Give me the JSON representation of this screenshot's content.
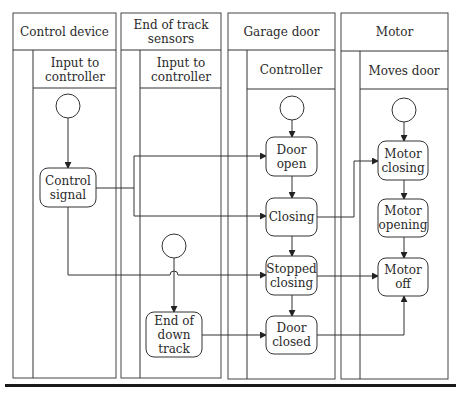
{
  "lanes": [
    {
      "title": "Control device",
      "subtitle": "Input to controller"
    },
    {
      "title": "End of track sensors",
      "subtitle": "Input to controller"
    },
    {
      "title": "Garage door",
      "subtitle": "Controller"
    },
    {
      "title": "Motor",
      "subtitle": "Moves door"
    }
  ],
  "nodes": {
    "control_signal": "Control signal",
    "end_of_down_track": "End of down track",
    "door_open": "Door open",
    "closing": "Closing",
    "stopped_closing": "Stopped closing",
    "door_closed": "Door closed",
    "motor_closing": "Motor closing",
    "motor_opening": "Motor opening",
    "motor_off": "Motor off"
  },
  "edges": [
    {
      "from": "control-device-start",
      "to": "control_signal"
    },
    {
      "from": "control_signal",
      "to": "door_open"
    },
    {
      "from": "control_signal",
      "to": "closing"
    },
    {
      "from": "control_signal",
      "to": "stopped_closing"
    },
    {
      "from": "end-of-track-start",
      "to": "end_of_down_track"
    },
    {
      "from": "end_of_down_track",
      "to": "door_closed"
    },
    {
      "from": "controller-start",
      "to": "door_open"
    },
    {
      "from": "door_open",
      "to": "closing"
    },
    {
      "from": "closing",
      "to": "stopped_closing"
    },
    {
      "from": "stopped_closing",
      "to": "door_closed"
    },
    {
      "from": "closing",
      "to": "motor_closing"
    },
    {
      "from": "stopped_closing",
      "to": "motor_off"
    },
    {
      "from": "door_closed",
      "to": "motor_off"
    },
    {
      "from": "motor-start",
      "to": "motor_closing"
    },
    {
      "from": "motor_closing",
      "to": "motor_opening"
    },
    {
      "from": "motor_opening",
      "to": "motor_off"
    }
  ]
}
